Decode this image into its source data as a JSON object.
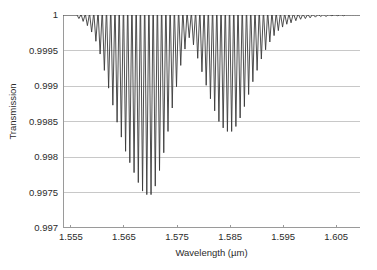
{
  "chart_data": {
    "type": "line",
    "title": "",
    "xlabel": "Wavelength (µm)",
    "ylabel": "Transmission",
    "xlim": [
      1.5535,
      1.6095
    ],
    "ylim": [
      0.997,
      1.0
    ],
    "xticks": [
      1.555,
      1.565,
      1.575,
      1.585,
      1.595,
      1.605
    ],
    "xtick_labels": [
      "1.555",
      "1.565",
      "1.575",
      "1.585",
      "1.595",
      "1.605"
    ],
    "yticks": [
      0.997,
      0.9975,
      0.998,
      0.9985,
      0.999,
      0.9995,
      1.0
    ],
    "ytick_labels": [
      "0.997",
      "0.9975",
      "0.998",
      "0.9985",
      "0.999",
      "0.9995",
      "1"
    ],
    "grid": "horizontal",
    "legend": "none",
    "line_color": "#3a3a3a",
    "grid_color": "#c8c8c8",
    "axis_color": "#9a9a9a",
    "baseline": 1.0,
    "resonances": [
      {
        "x": 1.5565,
        "y": 0.99995
      },
      {
        "x": 1.5573,
        "y": 0.99991
      },
      {
        "x": 1.5581,
        "y": 0.99985
      },
      {
        "x": 1.5589,
        "y": 0.99976
      },
      {
        "x": 1.5597,
        "y": 0.99963
      },
      {
        "x": 1.5605,
        "y": 0.99945
      },
      {
        "x": 1.5613,
        "y": 0.99922
      },
      {
        "x": 1.5621,
        "y": 0.99897
      },
      {
        "x": 1.5629,
        "y": 0.99873
      },
      {
        "x": 1.5637,
        "y": 0.99849
      },
      {
        "x": 1.5645,
        "y": 0.99828
      },
      {
        "x": 1.5653,
        "y": 0.99808
      },
      {
        "x": 1.5661,
        "y": 0.99792
      },
      {
        "x": 1.5669,
        "y": 0.99778
      },
      {
        "x": 1.5677,
        "y": 0.99764
      },
      {
        "x": 1.5685,
        "y": 0.99752
      },
      {
        "x": 1.5693,
        "y": 0.99747
      },
      {
        "x": 1.5701,
        "y": 0.99747
      },
      {
        "x": 1.5709,
        "y": 0.99759
      },
      {
        "x": 1.5717,
        "y": 0.99781
      },
      {
        "x": 1.5725,
        "y": 0.99806
      },
      {
        "x": 1.5733,
        "y": 0.99836
      },
      {
        "x": 1.5741,
        "y": 0.99869
      },
      {
        "x": 1.5749,
        "y": 0.99899
      },
      {
        "x": 1.5757,
        "y": 0.99929
      },
      {
        "x": 1.5765,
        "y": 0.99952
      },
      {
        "x": 1.5773,
        "y": 0.99968
      },
      {
        "x": 1.5781,
        "y": 0.99958
      },
      {
        "x": 1.5789,
        "y": 0.99939
      },
      {
        "x": 1.5797,
        "y": 0.9992
      },
      {
        "x": 1.5805,
        "y": 0.99901
      },
      {
        "x": 1.5813,
        "y": 0.99882
      },
      {
        "x": 1.5821,
        "y": 0.99865
      },
      {
        "x": 1.5829,
        "y": 0.9985
      },
      {
        "x": 1.5837,
        "y": 0.99841
      },
      {
        "x": 1.5845,
        "y": 0.99836
      },
      {
        "x": 1.5853,
        "y": 0.99836
      },
      {
        "x": 1.5861,
        "y": 0.99843
      },
      {
        "x": 1.5869,
        "y": 0.99855
      },
      {
        "x": 1.5877,
        "y": 0.99871
      },
      {
        "x": 1.5885,
        "y": 0.99888
      },
      {
        "x": 1.5893,
        "y": 0.99906
      },
      {
        "x": 1.5901,
        "y": 0.99922
      },
      {
        "x": 1.5909,
        "y": 0.99938
      },
      {
        "x": 1.5917,
        "y": 0.99951
      },
      {
        "x": 1.5925,
        "y": 0.99962
      },
      {
        "x": 1.5933,
        "y": 0.99971
      },
      {
        "x": 1.5941,
        "y": 0.99978
      },
      {
        "x": 1.5949,
        "y": 0.99983
      },
      {
        "x": 1.5957,
        "y": 0.99987
      },
      {
        "x": 1.5965,
        "y": 0.99989
      },
      {
        "x": 1.5974,
        "y": 0.99992
      },
      {
        "x": 1.5983,
        "y": 0.99994
      },
      {
        "x": 1.5992,
        "y": 0.99995
      },
      {
        "x": 1.6001,
        "y": 0.99996
      },
      {
        "x": 1.6011,
        "y": 0.99997
      },
      {
        "x": 1.6021,
        "y": 0.99998
      },
      {
        "x": 1.6031,
        "y": 0.99998
      },
      {
        "x": 1.6042,
        "y": 0.99999
      },
      {
        "x": 1.6053,
        "y": 0.99999
      },
      {
        "x": 1.6064,
        "y": 0.99999
      },
      {
        "x": 1.6076,
        "y": 1.0
      },
      {
        "x": 1.6088,
        "y": 1.0
      }
    ]
  }
}
